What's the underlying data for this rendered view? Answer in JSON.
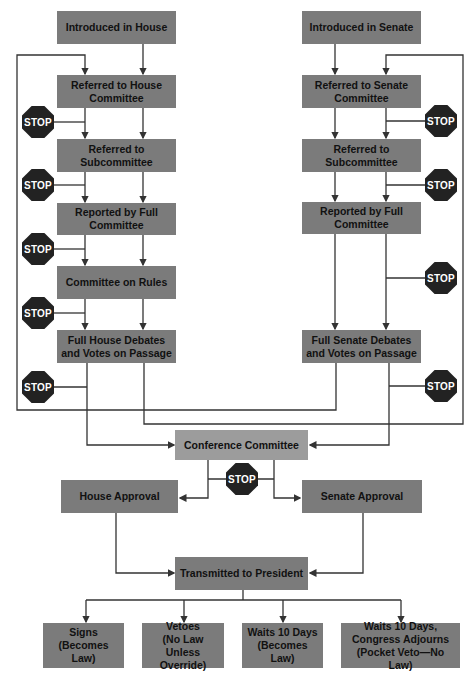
{
  "diagram": {
    "type": "flowchart",
    "house_column": [
      {
        "id": "introduced-house",
        "label": "Introduced in House"
      },
      {
        "id": "referred-house-committee",
        "label": "Referred to House\nCommittee"
      },
      {
        "id": "referred-house-subcommittee",
        "label": "Referred to\nSubcommittee"
      },
      {
        "id": "reported-house-full-committee",
        "label": "Reported by Full\nCommittee"
      },
      {
        "id": "committee-on-rules",
        "label": "Committee on Rules"
      },
      {
        "id": "full-house-debates",
        "label": "Full House Debates\nand Votes on Passage"
      }
    ],
    "senate_column": [
      {
        "id": "introduced-senate",
        "label": "Introduced in Senate"
      },
      {
        "id": "referred-senate-committee",
        "label": "Referred to Senate\nCommittee"
      },
      {
        "id": "referred-senate-subcommittee",
        "label": "Referred to\nSubcommittee"
      },
      {
        "id": "reported-senate-full-committee",
        "label": "Reported by Full\nCommittee"
      },
      {
        "id": "full-senate-debates",
        "label": "Full Senate Debates\nand Votes on Passage"
      }
    ],
    "conference": {
      "label": "Conference Committee"
    },
    "approvals": {
      "house": "House Approval",
      "senate": "Senate Approval"
    },
    "president": {
      "label": "Transmitted to President"
    },
    "outcomes": [
      {
        "id": "signs",
        "label": "Signs\n(Becomes Law)"
      },
      {
        "id": "vetoes",
        "label": "Vetoes\n(No Law Unless\nOverride)"
      },
      {
        "id": "waits",
        "label": "Waits 10 Days\n(Becomes Law)"
      },
      {
        "id": "pocket-veto",
        "label": "Waits 10 Days,\nCongress Adjourns\n(Pocket Veto—No Law)"
      }
    ],
    "stop_label": "STOP",
    "colors": {
      "box": "#7b7b7b",
      "conference_box": "#9c9c9c",
      "stop": "#222222",
      "line": "#333333"
    }
  }
}
